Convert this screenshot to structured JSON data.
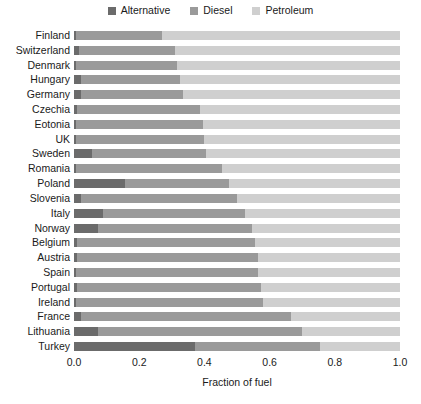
{
  "chart_data": {
    "type": "bar",
    "orientation": "horizontal",
    "stacked": true,
    "normalized": true,
    "title": "",
    "xlabel": "Fraction of fuel",
    "ylabel": "",
    "xlim": [
      0.0,
      1.0
    ],
    "grid": false,
    "legend_position": "top-center",
    "categories": [
      "Finland",
      "Switzerland",
      "Denmark",
      "Hungary",
      "Germany",
      "Czechia",
      "Eotonia",
      "UK",
      "Sweden",
      "Romania",
      "Poland",
      "Slovenia",
      "Italy",
      "Norway",
      "Belgium",
      "Austria",
      "Spain",
      "Portugal",
      "Ireland",
      "France",
      "Lithuania",
      "Turkey"
    ],
    "xticks": [
      0.0,
      0.2,
      0.4,
      0.6,
      0.8,
      1.0
    ],
    "xtick_labels": [
      "0.0",
      "0.2",
      "0.4",
      "0.6",
      "0.8",
      "1.0"
    ],
    "series": [
      {
        "name": "Alternative",
        "color": "#6b6b6b",
        "values": [
          0.005,
          0.015,
          0.005,
          0.02,
          0.02,
          0.01,
          0.005,
          0.005,
          0.055,
          0.005,
          0.155,
          0.02,
          0.09,
          0.075,
          0.01,
          0.01,
          0.005,
          0.01,
          0.005,
          0.02,
          0.075,
          0.37
        ]
      },
      {
        "name": "Diesel",
        "color": "#9a9a9a",
        "values": [
          0.265,
          0.295,
          0.31,
          0.305,
          0.315,
          0.375,
          0.39,
          0.395,
          0.35,
          0.45,
          0.32,
          0.48,
          0.435,
          0.47,
          0.545,
          0.555,
          0.56,
          0.565,
          0.575,
          0.645,
          0.625,
          0.385
        ]
      },
      {
        "name": "Petroleum",
        "color": "#cfcfcf",
        "values": [
          0.73,
          0.69,
          0.685,
          0.675,
          0.665,
          0.615,
          0.605,
          0.6,
          0.595,
          0.545,
          0.525,
          0.5,
          0.475,
          0.455,
          0.445,
          0.435,
          0.435,
          0.425,
          0.42,
          0.335,
          0.3,
          0.245
        ]
      }
    ]
  },
  "legend": {
    "entries": [
      {
        "label": "Alternative"
      },
      {
        "label": "Diesel"
      },
      {
        "label": "Petroleum"
      }
    ]
  }
}
